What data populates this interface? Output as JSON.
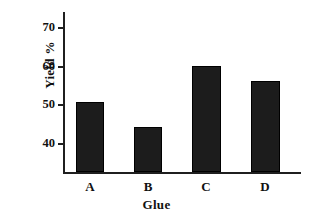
{
  "chart_data": {
    "type": "bar",
    "title": "",
    "xlabel": "Glue",
    "ylabel": "Yield %",
    "categories": [
      "A",
      "B",
      "C",
      "D"
    ],
    "values": [
      50.5,
      44,
      60,
      56
    ],
    "ylim": [
      32.3,
      74
    ],
    "yticks": [
      40,
      50,
      60,
      70
    ],
    "ytick_labels": [
      "40",
      "50",
      "60",
      "70"
    ],
    "grid": false,
    "legend": false,
    "bar_color": "#1c1c1c",
    "axis_color": "#1f1f1f",
    "background_color": "#ffffff"
  },
  "axes": {
    "y_title": "Yield %",
    "x_title": "Glue"
  },
  "ticks": {
    "y": [
      {
        "label": "70",
        "value": 70
      },
      {
        "label": "60",
        "value": 60
      },
      {
        "label": "50",
        "value": 50
      },
      {
        "label": "40",
        "value": 40
      }
    ]
  },
  "bars": [
    {
      "label": "A",
      "value": 50.5
    },
    {
      "label": "B",
      "value": 44
    },
    {
      "label": "C",
      "value": 60
    },
    {
      "label": "D",
      "value": 56
    }
  ]
}
